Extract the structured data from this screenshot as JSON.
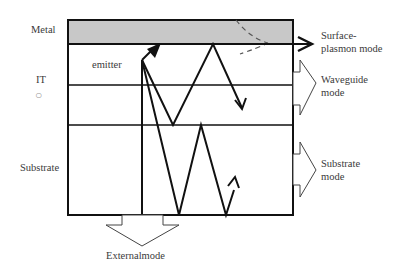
{
  "diagram": {
    "layers": [
      {
        "label": "Metal",
        "fill": "#c8c8c8"
      },
      {
        "label": "emitter"
      },
      {
        "label": "IT",
        "symbol": "○"
      },
      {
        "label": "Substrate"
      }
    ],
    "modes": {
      "surface_plasmon": [
        "Surface-",
        "plasmon mode"
      ],
      "waveguide": [
        "Waveguide",
        "mode"
      ],
      "substrate": [
        "Substrate",
        "mode"
      ],
      "external": "Externalmode"
    },
    "colors": {
      "line": "#111111",
      "metal_fill": "#c8c8c8",
      "dashed": "#555555",
      "text": "#3a3a3a"
    }
  }
}
